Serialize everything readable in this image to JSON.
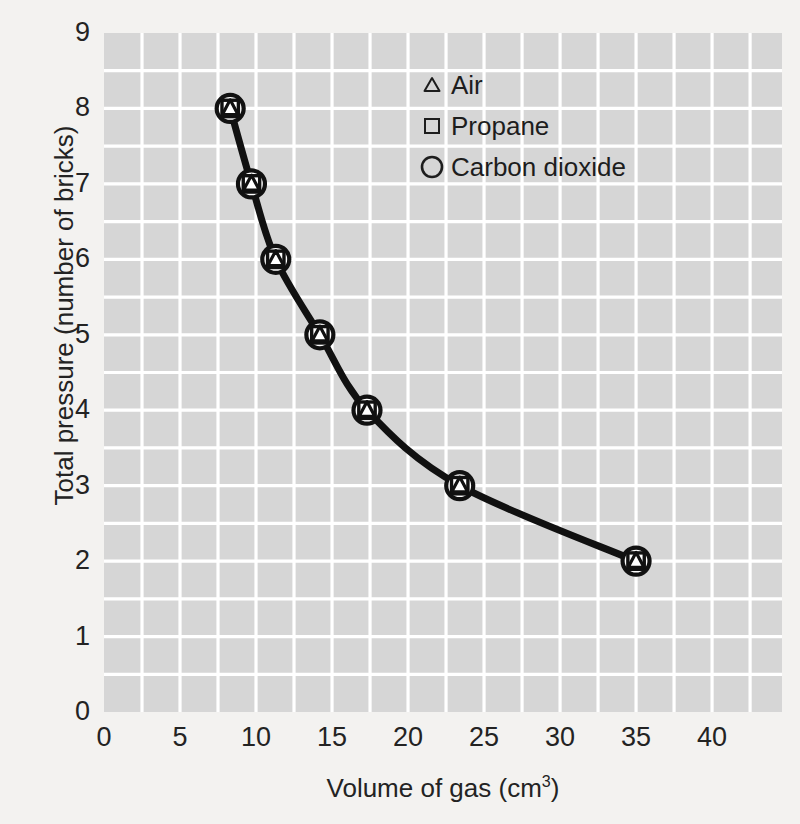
{
  "chart_data": {
    "type": "line",
    "title": "",
    "xlabel": "Volume of gas (cm3)",
    "xlabel_base": "Volume of gas (cm",
    "xlabel_sup": "3",
    "xlabel_tail": ")",
    "ylabel": "Total pressure (number of bricks)",
    "xlim": [
      0,
      44.6
    ],
    "ylim": [
      0,
      9
    ],
    "xticks": [
      0,
      5,
      10,
      15,
      20,
      25,
      30,
      35,
      40
    ],
    "yticks": [
      0,
      1,
      2,
      3,
      4,
      5,
      6,
      7,
      8,
      9
    ],
    "xtick_labels": [
      "0",
      "5",
      "10",
      "15",
      "20",
      "25",
      "30",
      "35",
      "40"
    ],
    "ytick_labels": [
      "0",
      "1",
      "2",
      "3",
      "4",
      "5",
      "6",
      "7",
      "8",
      "9"
    ],
    "grid": true,
    "grid_minor_step_x": 2.5,
    "grid_minor_step_y": 0.5,
    "grid_color": "#ffffff",
    "plot_bg": "#d6d6d6",
    "line_color": "#111111",
    "legend_position": "upper-right",
    "x": [
      8.3,
      9.7,
      11.3,
      14.2,
      17.3,
      23.4,
      35.0
    ],
    "series": [
      {
        "name": "Air",
        "marker": "triangle",
        "values": [
          8,
          7,
          6,
          5,
          4,
          3,
          2
        ]
      },
      {
        "name": "Propane",
        "marker": "square",
        "values": [
          8,
          7,
          6,
          5,
          4,
          3,
          2
        ]
      },
      {
        "name": "Carbon dioxide",
        "marker": "circle",
        "values": [
          8,
          7,
          6,
          5,
          4,
          3,
          2
        ]
      }
    ],
    "points": [
      {
        "x": 8.3,
        "y": 8
      },
      {
        "x": 9.7,
        "y": 7
      },
      {
        "x": 11.3,
        "y": 6
      },
      {
        "x": 14.2,
        "y": 5
      },
      {
        "x": 17.3,
        "y": 4
      },
      {
        "x": 23.4,
        "y": 3
      },
      {
        "x": 35.0,
        "y": 2
      }
    ]
  },
  "legend": {
    "items": [
      {
        "label": "Air",
        "marker": "triangle-marker-icon"
      },
      {
        "label": "Propane",
        "marker": "square-marker-icon"
      },
      {
        "label": "Carbon dioxide",
        "marker": "circle-marker-icon"
      }
    ]
  },
  "colors": {
    "page_background": "#f3f2f0",
    "plot_background": "#d6d6d6",
    "gridline": "#ffffff",
    "ink": "#1d1d1d",
    "curve": "#111111"
  }
}
